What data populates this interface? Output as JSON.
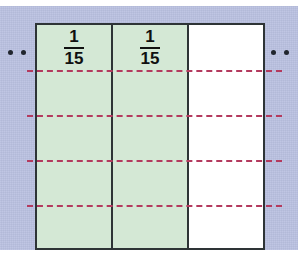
{
  "figure": {
    "name": "fraction-bar-model",
    "background_color": "#b9c0e0",
    "border_color": "#2e3436",
    "shaded_color": "#d4e8d5",
    "unshaded_color": "#ffffff",
    "dash_color": "#b43a5e",
    "dot_color": "#21262e"
  },
  "bar": {
    "cells": [
      {
        "label_numerator": "1",
        "label_denominator": "15",
        "shaded": true
      },
      {
        "label_numerator": "1",
        "label_denominator": "15",
        "shaded": true
      },
      {
        "label_numerator": "",
        "label_denominator": "",
        "shaded": false
      }
    ]
  },
  "dashed_lines": {
    "count": 4,
    "y_positions": [
      70,
      115,
      160,
      205
    ]
  },
  "ellipsis": {
    "left": [
      {
        "x": 8,
        "y": 50
      },
      {
        "x": 21,
        "y": 50
      }
    ],
    "right": [
      {
        "x": 271,
        "y": 50
      },
      {
        "x": 284,
        "y": 50
      }
    ]
  }
}
